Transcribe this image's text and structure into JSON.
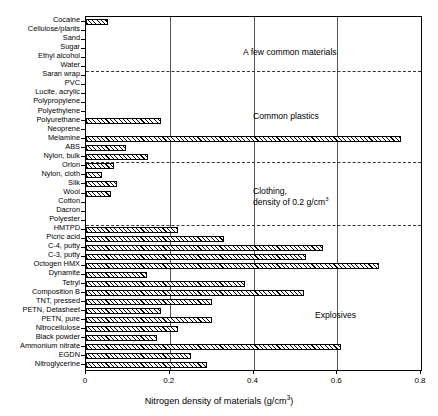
{
  "chart_data": {
    "type": "bar",
    "orientation": "horizontal",
    "title": "",
    "xlabel": "Nitrogen density of materials (g/cm3)",
    "ylabel": "",
    "xlim": [
      0,
      0.8
    ],
    "xticks": [
      0,
      0.2,
      0.4,
      0.6,
      0.8
    ],
    "xticklabels": [
      "0",
      "0.2",
      "0.4",
      "0.6",
      "0.8"
    ],
    "grid": true,
    "legend": false,
    "units": "g/cm^3",
    "categories": [
      "Cocaine",
      "Cellulose/plants",
      "Sand",
      "Sugar",
      "Ethyl alcohol",
      "Water",
      "Saran wrap",
      "PVC",
      "Lucite, acrylic",
      "Polypropylene",
      "Polyethylene",
      "Polyurethane",
      "Neoprene",
      "Melamine",
      "ABS",
      "Nylon, bulk",
      "Orlon",
      "Nylon, cloth",
      "Silk",
      "Wool",
      "Cotton",
      "Dacron",
      "Polyester",
      "HMTPD",
      "Picric acid",
      "C-4, putty",
      "C-3, putty",
      "Octogen HMX",
      "Dynamite",
      "Tetryl",
      "Composition B",
      "TNT, pressed",
      "PETN, Detasheet",
      "PETN, pure",
      "Nitrocellulose",
      "Black powder",
      "Ammonium nitrate",
      "EGDN",
      "Nitroglycerine"
    ],
    "values": [
      0.053,
      0.0,
      0.0,
      0.0,
      0.0,
      0.0,
      0.0,
      0.0,
      0.0,
      0.0,
      0.0,
      0.18,
      0.0,
      0.752,
      0.096,
      0.148,
      0.067,
      0.038,
      0.074,
      0.06,
      0.0,
      0.0,
      0.0,
      0.22,
      0.33,
      0.565,
      0.525,
      0.7,
      0.145,
      0.38,
      0.52,
      0.3,
      0.18,
      0.3,
      0.22,
      0.17,
      0.61,
      0.25,
      0.29
    ],
    "group_annotations": [
      {
        "text": "A few common materials",
        "after_category": "Water"
      },
      {
        "text": "Common plastics",
        "after_category": "Nylon, bulk"
      },
      {
        "text": "Clothing,\ndensity of 0.2 g/cm3",
        "after_category": "Polyester"
      },
      {
        "text": "Explosives",
        "after_category": "Nitroglycerine"
      }
    ],
    "group_separators_after": [
      "Water",
      "Nylon, bulk",
      "Polyester"
    ]
  },
  "axis": {
    "x_title_main": "Nitrogen density of materials (g/cm",
    "x_title_sup": "3",
    "x_title_end": ")"
  },
  "annotations": {
    "common_materials": "A few common materials",
    "common_plastics": "Common plastics",
    "clothing_line1": "Clothing,",
    "clothing_line2_main": "density of 0.2 g/cm",
    "clothing_line2_sup": "3",
    "explosives": "Explosives"
  },
  "colors": {
    "bar_edge": "#000000",
    "bar_hatch": "#000000",
    "grid": "#555555",
    "separator": "#333333",
    "background": "#ffffff"
  }
}
